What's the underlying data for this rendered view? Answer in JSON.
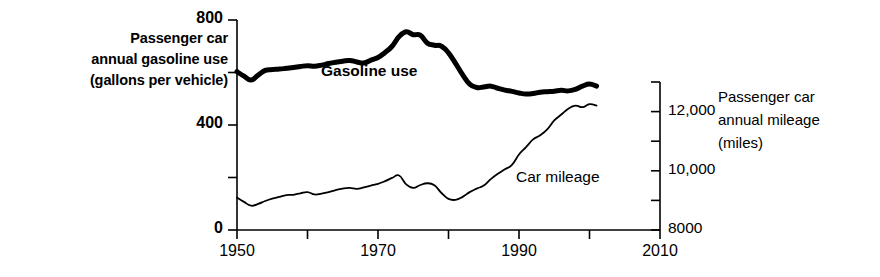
{
  "chart_data": {
    "type": "line",
    "title": "",
    "xlabel": "",
    "xlim": [
      1950,
      2010
    ],
    "xticks": [
      1950,
      1960,
      1970,
      1980,
      1990,
      2000,
      2010
    ],
    "xtick_labels": [
      "1950",
      "",
      "1970",
      "",
      "1990",
      "",
      "2010"
    ],
    "grid": false,
    "legend_position": "inline-annotations",
    "axes": [
      {
        "id": "left",
        "label": "Passenger car annual gasoline use (gallons per vehicle)",
        "label_lines": [
          "Passenger car",
          "annual gasoline use",
          "(gallons per vehicle)"
        ],
        "ylim": [
          0,
          800
        ],
        "yticks": [
          0,
          200,
          400,
          600,
          800
        ],
        "ytick_labels": [
          "0",
          "",
          "400",
          "",
          "800"
        ],
        "units": "gallons per vehicle"
      },
      {
        "id": "right",
        "label": "Passenger car annual mileage (miles)",
        "label_lines": [
          "Passenger car",
          "annual mileage",
          "(miles)"
        ],
        "ylim": [
          8000,
          13000
        ],
        "yticks": [
          8000,
          9000,
          10000,
          11000,
          12000,
          13000
        ],
        "ytick_labels": [
          "8000",
          "",
          "10,000",
          "",
          "12,000",
          ""
        ],
        "units": "miles"
      }
    ],
    "series": [
      {
        "name": "Gasoline use",
        "annotation": "Gasoline use",
        "axis": "left",
        "style": "thick-black-line",
        "color": "#000000",
        "linewidth": 5,
        "x": [
          1950,
          1951,
          1952,
          1953,
          1954,
          1955,
          1956,
          1957,
          1958,
          1959,
          1960,
          1961,
          1962,
          1963,
          1964,
          1965,
          1966,
          1967,
          1968,
          1969,
          1970,
          1971,
          1972,
          1973,
          1974,
          1975,
          1976,
          1977,
          1978,
          1979,
          1980,
          1981,
          1982,
          1983,
          1984,
          1985,
          1986,
          1987,
          1988,
          1989,
          1990,
          1991,
          1992,
          1993,
          1994,
          1995,
          1996,
          1997,
          1998,
          1999,
          2000,
          2001
        ],
        "y": [
          603,
          586,
          571,
          590,
          608,
          611,
          613,
          616,
          619,
          623,
          626,
          624,
          628,
          634,
          639,
          643,
          646,
          640,
          636,
          647,
          657,
          676,
          700,
          737,
          755,
          744,
          742,
          712,
          704,
          700,
          675,
          635,
          592,
          556,
          543,
          545,
          548,
          540,
          533,
          528,
          522,
          518,
          520,
          525,
          527,
          529,
          532,
          530,
          536,
          548,
          556,
          548
        ]
      },
      {
        "name": "Car mileage",
        "annotation": "Car mileage",
        "axis": "right",
        "style": "thin-black-line",
        "color": "#000000",
        "linewidth": 1.8,
        "x": [
          1950,
          1951,
          1952,
          1953,
          1954,
          1955,
          1956,
          1957,
          1958,
          1959,
          1960,
          1961,
          1962,
          1963,
          1964,
          1965,
          1966,
          1967,
          1968,
          1969,
          1970,
          1971,
          1972,
          1973,
          1974,
          1975,
          1976,
          1977,
          1978,
          1979,
          1980,
          1981,
          1982,
          1983,
          1984,
          1985,
          1986,
          1987,
          1988,
          1989,
          1990,
          1991,
          1992,
          1993,
          1994,
          1995,
          1996,
          1997,
          1998,
          1999,
          2000,
          2001
        ],
        "y": [
          9100,
          8950,
          8820,
          8880,
          8980,
          9060,
          9120,
          9180,
          9190,
          9240,
          9280,
          9200,
          9230,
          9280,
          9350,
          9400,
          9420,
          9390,
          9440,
          9500,
          9560,
          9650,
          9760,
          9840,
          9540,
          9420,
          9520,
          9580,
          9510,
          9250,
          9050,
          9020,
          9120,
          9280,
          9400,
          9500,
          9720,
          9900,
          10050,
          10200,
          10550,
          10800,
          11060,
          11200,
          11400,
          11700,
          11900,
          12100,
          12200,
          12150,
          12250,
          12200
        ]
      }
    ]
  }
}
